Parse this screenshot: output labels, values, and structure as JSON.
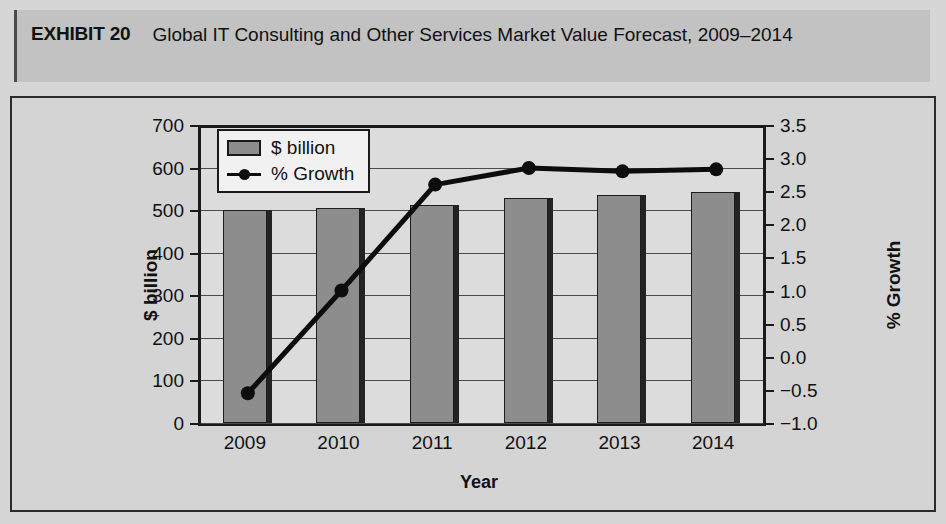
{
  "exhibit": {
    "label": "EXHIBIT 20",
    "title": "Global IT Consulting and Other Services Market Value Forecast, 2009–2014"
  },
  "chart_data": {
    "type": "bar",
    "title": "Global IT Consulting and Other Services Market Value Forecast, 2009–2014",
    "xlabel": "Year",
    "ylabel": "$ billion",
    "y2label": "% Growth",
    "categories": [
      "2009",
      "2010",
      "2011",
      "2012",
      "2013",
      "2014"
    ],
    "series": [
      {
        "name": "$ billion",
        "type": "bar",
        "axis": "left",
        "color": "#8d8d8d",
        "values": [
          500,
          505,
          513,
          528,
          535,
          543
        ]
      },
      {
        "name": "% Growth",
        "type": "line",
        "axis": "right",
        "color": "#0d0d0d",
        "values": [
          -0.55,
          1.0,
          2.6,
          2.85,
          2.8,
          2.83
        ]
      }
    ],
    "ylim": [
      0,
      700
    ],
    "yticks": [
      "0",
      "100",
      "200",
      "300",
      "400",
      "500",
      "600",
      "700"
    ],
    "y2lim": [
      -1.0,
      3.5
    ],
    "y2ticks": [
      "−1.0",
      "−0.5",
      "0.0",
      "0.5",
      "1.0",
      "1.5",
      "2.0",
      "2.5",
      "3.0",
      "3.5"
    ],
    "grid": true,
    "legend_position": "top-left",
    "legend": [
      "$ billion",
      "% Growth"
    ]
  }
}
